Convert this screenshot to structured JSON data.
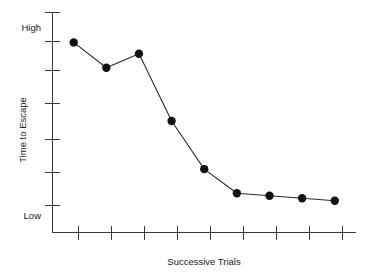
{
  "chart_data": {
    "type": "line",
    "title": "",
    "subtitle": "",
    "xlabel": "Successive Trials",
    "ylabel": "Time to Escape",
    "x": [
      1,
      2,
      3,
      4,
      5,
      6,
      7,
      8,
      9
    ],
    "categories": [
      "1",
      "2",
      "3",
      "4",
      "5",
      "6",
      "7",
      "8",
      "9"
    ],
    "values": [
      6.0,
      5.0,
      5.55,
      2.9,
      1.0,
      0.05,
      -0.05,
      -0.15,
      -0.25
    ],
    "series": [
      {
        "name": "Time to Escape",
        "values": [
          6.0,
          5.0,
          5.55,
          2.9,
          1.0,
          0.05,
          -0.05,
          -0.15,
          -0.25
        ]
      }
    ],
    "ylim": [
      -1.5,
      7.2
    ],
    "xlim": [
      0.35,
      9.65
    ],
    "ytick_values": [
      6,
      5,
      4,
      3,
      2,
      1,
      0
    ],
    "ytick_labels": [
      "High",
      "",
      "",
      "",
      "",
      "",
      "Low"
    ],
    "y_axis_tick_count": 7,
    "x_axis_tick_count": 9,
    "xtick_labels": [
      "",
      "",
      "",
      "",
      "",
      "",
      "",
      "",
      ""
    ],
    "grid": false,
    "legend": false,
    "legend_position": "none",
    "marker": "filled-circle",
    "marker_size": 4.2,
    "line_color": "#2b2b2b",
    "marker_color": "#111111",
    "axis_color": "#3a3a3a",
    "background_color": "#ffffff",
    "annotations": []
  },
  "axis": {
    "y_high_label": "High",
    "y_low_label": "Low",
    "y_title": "Time to Escape",
    "x_title": "Successive Trials"
  },
  "colors": {
    "line": "#2b2b2b",
    "marker": "#111111",
    "axis": "#3a3a3a",
    "text": "#1a1a1a",
    "background": "#ffffff"
  }
}
